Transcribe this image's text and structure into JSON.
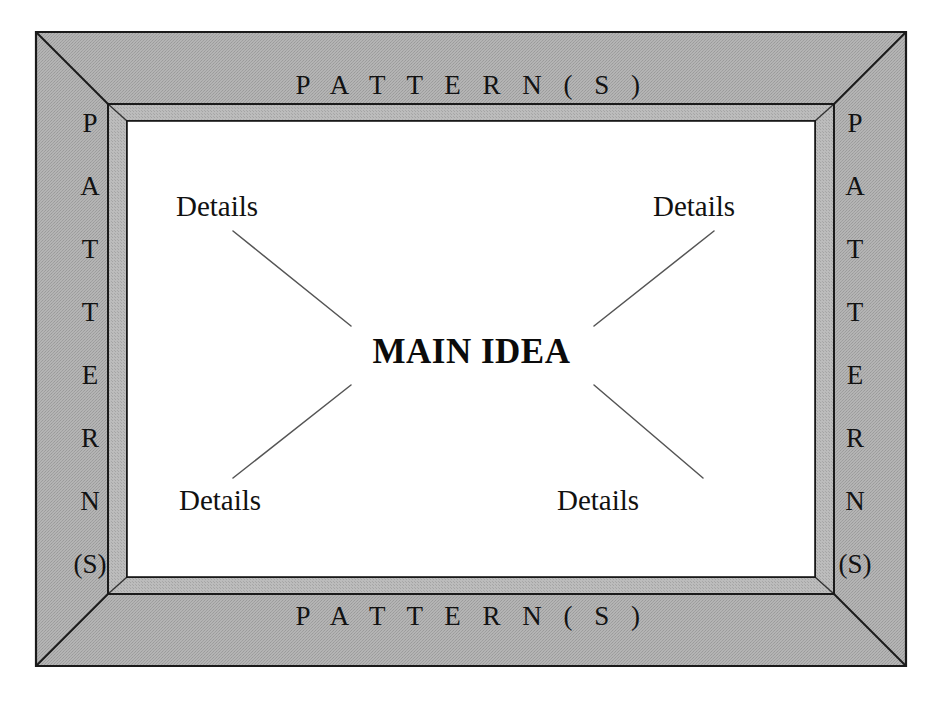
{
  "diagram": {
    "type": "main-idea-details-graphic-organizer",
    "center": {
      "label": "MAIN IDEA"
    },
    "details": [
      {
        "id": "top-left",
        "label": "Details"
      },
      {
        "id": "top-right",
        "label": "Details"
      },
      {
        "id": "bottom-left",
        "label": "Details"
      },
      {
        "id": "bottom-right",
        "label": "Details"
      }
    ],
    "frame": {
      "top_label": "P A T T E R N ( S )",
      "bottom_label": "P A T T E R N ( S )",
      "left_label_letters": [
        "P",
        "A",
        "T",
        "T",
        "E",
        "R",
        "N",
        "(S)"
      ],
      "right_label_letters": [
        "P",
        "A",
        "T",
        "T",
        "E",
        "R",
        "N",
        "(S)"
      ],
      "plain_label": "PATTERN(S)"
    },
    "colors": {
      "frame_fill": "#aaaaaa",
      "frame_fill_inner_bevel": "#b2b2b2",
      "frame_outline": "#1a1a1a",
      "canvas": "#ffffff",
      "text": "#111111",
      "connector": "#555555"
    }
  }
}
